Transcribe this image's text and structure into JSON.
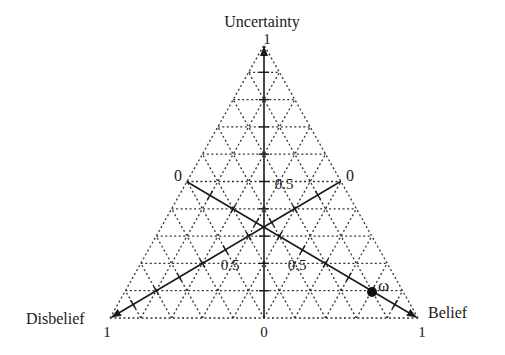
{
  "diagram": {
    "type": "opinion-triangle",
    "vertices": {
      "top": {
        "label": "Uncertainty",
        "value": "1"
      },
      "left": {
        "label": "Disbelief",
        "value": "1"
      },
      "right": {
        "label": "Belief",
        "value": "1"
      }
    },
    "edge_labels": {
      "left_mid": "0",
      "right_mid": "0",
      "bottom_mid": "0"
    },
    "axis_labels": {
      "uncertainty_half": "0.5",
      "disbelief_half": "0.5",
      "belief_half": "0.5"
    },
    "point": {
      "label": "ω"
    },
    "grid_divisions": 10,
    "colors": {
      "line": "#1a1a1a",
      "grid": "#333333",
      "background": "#ffffff"
    }
  }
}
